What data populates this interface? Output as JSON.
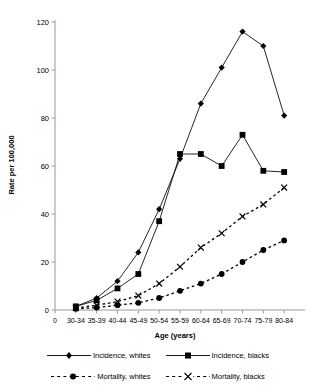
{
  "chart_data": {
    "type": "line",
    "title": "",
    "xlabel": "Age (years)",
    "ylabel": "Rate per 100,000",
    "categories": [
      "30-34",
      "35-39",
      "40-44",
      "45-49",
      "50-54",
      "55-59",
      "60-64",
      "65-69",
      "70-74",
      "75-79",
      "80-84"
    ],
    "ylim": [
      0,
      120
    ],
    "yticks": [
      0,
      20,
      40,
      60,
      80,
      100,
      120
    ],
    "xtick_labels": [
      "0",
      "30-34",
      "35-39",
      "40-44",
      "45-49",
      "50-54",
      "55-59",
      "60-64",
      "65-69",
      "70-74",
      "75-79",
      "80-84"
    ],
    "grid": false,
    "legend_position": "bottom",
    "series": [
      {
        "name": "Incidence, whites",
        "marker": "diamond",
        "line": "solid",
        "color": "#000000",
        "values": [
          1.5,
          5,
          12,
          24,
          42,
          63,
          86,
          101,
          116,
          110,
          81
        ]
      },
      {
        "name": "Incidence, blacks",
        "marker": "square",
        "line": "solid",
        "color": "#000000",
        "values": [
          1.5,
          4,
          9,
          15,
          37,
          65,
          65,
          60,
          73,
          58,
          57.5
        ]
      },
      {
        "name": "Mortality, whites",
        "marker": "circle",
        "line": "dashed",
        "color": "#000000",
        "values": [
          0.5,
          1,
          2,
          3,
          5,
          8,
          11,
          15,
          20,
          25,
          29
        ]
      },
      {
        "name": "Mortality, blacks",
        "marker": "cross",
        "line": "dashed",
        "color": "#000000",
        "values": [
          0.8,
          2,
          3.5,
          6,
          11,
          18,
          26,
          32,
          39,
          44,
          51
        ]
      }
    ]
  },
  "legend": {
    "entries": [
      {
        "label": "Incidence, whites"
      },
      {
        "label": "Incidence, blacks"
      },
      {
        "label": "Mortality, whites"
      },
      {
        "label": "Mortality, blacks"
      }
    ]
  }
}
